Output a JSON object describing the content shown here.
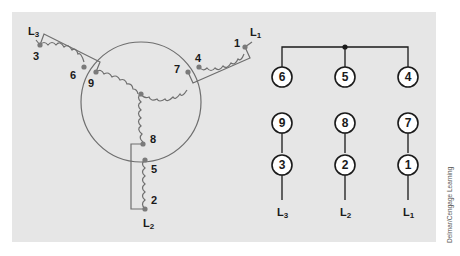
{
  "diagram": {
    "type": "nine-lead wye motor connection (low voltage)",
    "colors": {
      "panel": "#e6e6e6",
      "wire": "#6e6e6e",
      "terminal_dot": "#7a7a7a",
      "text": "#1a1a1a",
      "circle_fill": "#ffffff"
    },
    "wye": {
      "line_labels": {
        "L1": {
          "main": "L",
          "sub": "1"
        },
        "L2": {
          "main": "L",
          "sub": "2"
        },
        "L3": {
          "main": "L",
          "sub": "3"
        }
      },
      "terminals": [
        "1",
        "2",
        "3",
        "4",
        "5",
        "6",
        "7",
        "8",
        "9"
      ]
    },
    "connection_table": {
      "top_row": [
        "6",
        "5",
        "4"
      ],
      "middle_row": [
        "9",
        "8",
        "7"
      ],
      "bottom_row": [
        "3",
        "2",
        "1"
      ],
      "lines": [
        {
          "main": "L",
          "sub": "3"
        },
        {
          "main": "L",
          "sub": "2"
        },
        {
          "main": "L",
          "sub": "1"
        }
      ]
    }
  },
  "credit": "Delmar/Cengage Learning"
}
